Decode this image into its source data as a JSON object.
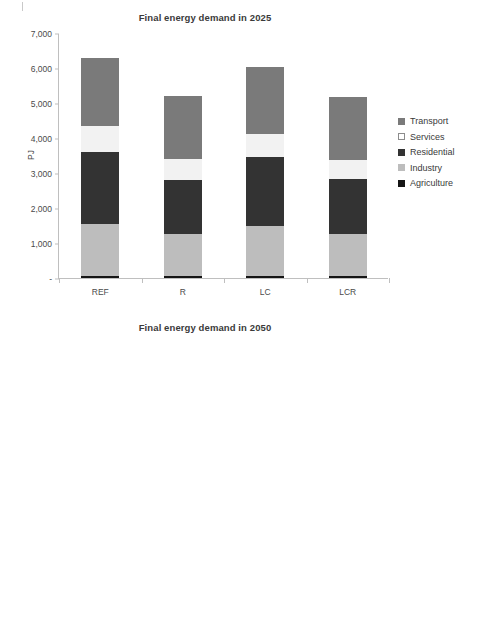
{
  "page": {
    "background": "#ffffff"
  },
  "palette": {
    "transport": "#7a7a7a",
    "services": "#f2f2f2",
    "residential": "#333333",
    "industry": "#bdbdbd",
    "agriculture": "#151515",
    "axis": "#bfbfbf",
    "text": "#3a3a3a"
  },
  "legend": {
    "items": [
      {
        "label": "Transport",
        "color": "#7a7a7a",
        "style": "filled"
      },
      {
        "label": "Services",
        "color": "#ffffff",
        "style": "outline"
      },
      {
        "label": "Residential",
        "color": "#333333",
        "style": "filled"
      },
      {
        "label": "Industry",
        "color": "#bdbdbd",
        "style": "filled"
      },
      {
        "label": "Agriculture",
        "color": "#151515",
        "style": "filled"
      }
    ]
  },
  "axis": {
    "ylabel": "PJ",
    "yticks": [
      "7,000",
      "6,000",
      "5,000",
      "4,000",
      "3,000",
      "2,000",
      "1,000",
      "-"
    ],
    "ytick_values": [
      7000,
      6000,
      5000,
      4000,
      3000,
      2000,
      1000,
      0
    ],
    "ylim": [
      0,
      7000
    ],
    "categories": [
      "REF",
      "R",
      "LC",
      "LCR"
    ]
  },
  "chart_data": [
    {
      "type": "bar",
      "subtype": "stacked-column",
      "title": "Final energy demand in 2025",
      "xlabel": "",
      "ylabel": "PJ",
      "ylim": [
        0,
        7000
      ],
      "ytick_labels": [
        "-",
        "1,000",
        "2,000",
        "3,000",
        "4,000",
        "5,000",
        "6,000",
        "7,000"
      ],
      "grid": false,
      "legend_position": "right",
      "categories": [
        "REF",
        "R",
        "LC",
        "LCR"
      ],
      "series": [
        {
          "name": "Agriculture",
          "color": "#151515",
          "values": [
            70,
            60,
            70,
            60
          ]
        },
        {
          "name": "Industry",
          "color": "#bdbdbd",
          "values": [
            1480,
            1200,
            1410,
            1190
          ]
        },
        {
          "name": "Residential",
          "color": "#333333",
          "values": [
            2060,
            1540,
            1970,
            1590
          ]
        },
        {
          "name": "Services",
          "color": "#f2f2f2",
          "values": [
            740,
            610,
            670,
            540
          ]
        },
        {
          "name": "Transport",
          "color": "#7a7a7a",
          "values": [
            1950,
            1790,
            1910,
            1790
          ]
        }
      ],
      "totals": [
        6300,
        5200,
        6030,
        5170
      ]
    },
    {
      "type": "bar",
      "subtype": "stacked-column",
      "title": "Final energy demand in 2050",
      "xlabel": "",
      "ylabel": "PJ",
      "ylim": [
        0,
        7000
      ],
      "ytick_labels": [
        "-",
        "1,000",
        "2,000",
        "3,000",
        "4,000",
        "5,000",
        "6,000",
        "7,000"
      ],
      "grid": false,
      "legend_position": "right",
      "categories": [
        "REF",
        "R",
        "LC",
        "LCR"
      ],
      "series": [
        {
          "name": "Agriculture",
          "color": "#151515",
          "values": [
            70,
            50,
            60,
            50
          ]
        },
        {
          "name": "Industry",
          "color": "#bdbdbd",
          "values": [
            1530,
            1020,
            1240,
            1040
          ]
        },
        {
          "name": "Residential",
          "color": "#333333",
          "values": [
            1930,
            970,
            910,
            980
          ]
        },
        {
          "name": "Services",
          "color": "#f2f2f2",
          "values": [
            770,
            520,
            640,
            400
          ]
        },
        {
          "name": "Transport",
          "color": "#7a7a7a",
          "values": [
            2150,
            1260,
            1520,
            1180
          ]
        }
      ],
      "totals": [
        6450,
        3820,
        4370,
        3650
      ]
    }
  ]
}
